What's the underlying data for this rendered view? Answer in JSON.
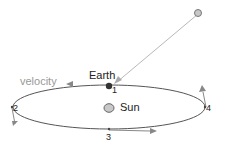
{
  "labels": {
    "earth": "Earth",
    "sun": "Sun",
    "velocity": "velocity",
    "points": [
      "1",
      "2",
      "3",
      "4"
    ]
  },
  "colors": {
    "orbit": "#555555",
    "arrow": "#888888",
    "earth": "#333333",
    "sun_fill": "#c8c8c8",
    "sun_stroke": "#666666",
    "pull_line": "#b0b0b0",
    "velocity_text": "#999999",
    "text": "#222222"
  }
}
